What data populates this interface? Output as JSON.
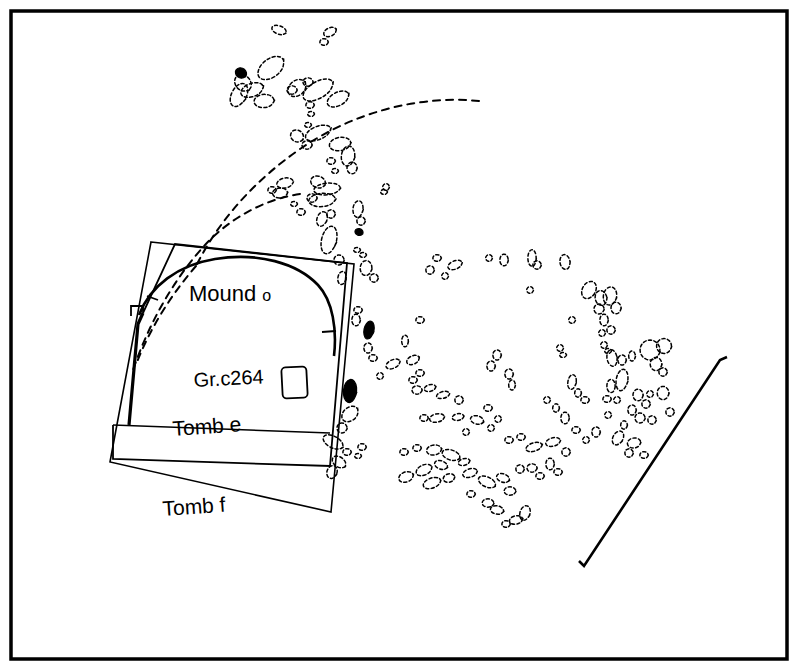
{
  "figure": {
    "type": "archaeological-site-plan",
    "background_color": "#ffffff",
    "ink_color": "#000000",
    "frame": {
      "name": "plan-border",
      "x": 11,
      "y": 11,
      "width": 776,
      "height": 648,
      "stroke_width": 3.5
    }
  },
  "labels": {
    "mound": {
      "text_main": "Mound",
      "text_suffix": "o",
      "x": 189,
      "y": 301,
      "size_main": 22,
      "size_suffix": 16
    },
    "grave": {
      "text": "Gr.c264",
      "x": 194,
      "y": 387,
      "size": 20
    },
    "tomb_e": {
      "text": "Tomb e",
      "x": 173,
      "y": 436,
      "size": 21
    },
    "tomb_f": {
      "text": "Tomb f",
      "x": 163,
      "y": 516,
      "size": 21
    }
  },
  "structures": {
    "tomb_f_outline": {
      "name": "tomb-f-outline",
      "points": "151,242 354,264 331,512 110,462",
      "stroke_width": 1.6
    },
    "tomb_e_outline": {
      "name": "tomb-e-outline",
      "points": "131,316 131,306 143,306 143,313 175,244 347,263 330,466 113,459 113,425",
      "stroke_width": 1.8
    },
    "tomb_e_west_wall": {
      "name": "tomb-e-west-wall",
      "points": "143,313 138,324 129,425",
      "stroke_width": 3.2
    },
    "tomb_e_inner_base": {
      "name": "tomb-e-inner-base",
      "points": "113,425 330,433",
      "stroke_width": 1.5
    },
    "mound_arc": {
      "name": "mound-o-arc",
      "path": "M 139,315 C 150,286 178,265 215,259 C 258,252 297,263 318,285 C 333,301 337,330 334,356",
      "stroke_width": 2.6
    },
    "mound_arc_tick_left": {
      "name": "mound-arc-tick-left",
      "points": "147,296 158,300",
      "stroke_width": 1.8
    },
    "mound_arc_tick_right": {
      "name": "mound-arc-tick-right",
      "points": "322,332 336,331",
      "stroke_width": 1.8
    },
    "grave_rect": {
      "name": "grave-c264-rectangle",
      "x": 282,
      "y": 367,
      "width": 25,
      "height": 31,
      "rx": 4,
      "rotation": -3,
      "stroke_width": 1.8
    },
    "baulk_line": {
      "name": "baulk-diagonal-line",
      "path": "M 727,357 L 720,360 L 584,566 L 579,561",
      "stroke_width": 2.6
    },
    "dashed_arc_outer": {
      "name": "dashed-arc-outer",
      "path": "M 479,101 C 420,95 355,112 303,147 C 254,180 218,222 196,266",
      "stroke_width": 2.0,
      "dash": "7,6"
    },
    "dashed_arc_inner": {
      "name": "dashed-arc-inner",
      "path": "M 300,194 C 266,199 231,217 205,245 C 172,281 148,326 133,370",
      "stroke_width": 2.0,
      "dash": "7,6"
    },
    "dashed_arc_west": {
      "name": "dashed-arc-west",
      "path": "M 196,266 C 170,296 150,329 137,362",
      "stroke_width": 2.0,
      "dash": "7,6"
    }
  },
  "black_stones": [
    {
      "name": "black-stone-nw",
      "cx": 241,
      "cy": 73,
      "rx": 7,
      "ry": 6,
      "rot": 30
    },
    {
      "name": "black-stone-mid",
      "cx": 359,
      "cy": 232,
      "rx": 5,
      "ry": 4,
      "rot": 20
    },
    {
      "name": "black-stone-upper-east",
      "cx": 369,
      "cy": 330,
      "rx": 6,
      "ry": 11,
      "rot": 12
    },
    {
      "name": "black-stone-lower-east",
      "cx": 350,
      "cy": 391,
      "rx": 8,
      "ry": 14,
      "rot": 6
    }
  ],
  "dashed_stones": [
    {
      "cx": 279,
      "cy": 30,
      "rx": 9,
      "ry": 5,
      "rot": 20
    },
    {
      "cx": 324,
      "cy": 42,
      "rx": 5,
      "ry": 4,
      "rot": 0
    },
    {
      "cx": 330,
      "cy": 32,
      "rx": 8,
      "ry": 5,
      "rot": -25
    },
    {
      "cx": 271,
      "cy": 68,
      "rx": 18,
      "ry": 11,
      "rot": -38
    },
    {
      "cx": 297,
      "cy": 88,
      "rx": 12,
      "ry": 9,
      "rot": -40
    },
    {
      "cx": 252,
      "cy": 90,
      "rx": 14,
      "ry": 8,
      "rot": -20
    },
    {
      "cx": 243,
      "cy": 83,
      "rx": 11,
      "ry": 9,
      "rot": 45
    },
    {
      "cx": 239,
      "cy": 95,
      "rx": 9,
      "ry": 15,
      "rot": 28
    },
    {
      "cx": 264,
      "cy": 101,
      "rx": 12,
      "ry": 8,
      "rot": -5
    },
    {
      "cx": 292,
      "cy": 90,
      "rx": 6,
      "ry": 5,
      "rot": 0
    },
    {
      "cx": 318,
      "cy": 90,
      "rx": 20,
      "ry": 10,
      "rot": -30
    },
    {
      "cx": 338,
      "cy": 99,
      "rx": 14,
      "ry": 8,
      "rot": -28
    },
    {
      "cx": 308,
      "cy": 82,
      "rx": 6,
      "ry": 5,
      "rot": 0
    },
    {
      "cx": 310,
      "cy": 105,
      "rx": 5,
      "ry": 4,
      "rot": 0
    },
    {
      "cx": 311,
      "cy": 114,
      "rx": 4,
      "ry": 3,
      "rot": 0
    },
    {
      "cx": 308,
      "cy": 125,
      "rx": 4,
      "ry": 3,
      "rot": 0
    },
    {
      "cx": 318,
      "cy": 133,
      "rx": 16,
      "ry": 8,
      "rot": -22
    },
    {
      "cx": 340,
      "cy": 144,
      "rx": 13,
      "ry": 8,
      "rot": -10
    },
    {
      "cx": 297,
      "cy": 136,
      "rx": 8,
      "ry": 7,
      "rot": 30
    },
    {
      "cx": 307,
      "cy": 145,
      "rx": 6,
      "ry": 5,
      "rot": 0
    },
    {
      "cx": 348,
      "cy": 156,
      "rx": 8,
      "ry": 12,
      "rot": 8
    },
    {
      "cx": 352,
      "cy": 168,
      "rx": 6,
      "ry": 7,
      "rot": 0
    },
    {
      "cx": 331,
      "cy": 161,
      "rx": 5,
      "ry": 4,
      "rot": 0
    },
    {
      "cx": 335,
      "cy": 171,
      "rx": 4,
      "ry": 3,
      "rot": 0
    },
    {
      "cx": 285,
      "cy": 183,
      "rx": 10,
      "ry": 6,
      "rot": -12
    },
    {
      "cx": 280,
      "cy": 193,
      "rx": 9,
      "ry": 6,
      "rot": -5
    },
    {
      "cx": 272,
      "cy": 190,
      "rx": 5,
      "ry": 4,
      "rot": 0
    },
    {
      "cx": 318,
      "cy": 182,
      "rx": 9,
      "ry": 7,
      "rot": 18
    },
    {
      "cx": 327,
      "cy": 189,
      "rx": 16,
      "ry": 7,
      "rot": -6
    },
    {
      "cx": 322,
      "cy": 200,
      "rx": 16,
      "ry": 8,
      "rot": -5
    },
    {
      "cx": 312,
      "cy": 198,
      "rx": 6,
      "ry": 5,
      "rot": 0
    },
    {
      "cx": 294,
      "cy": 204,
      "rx": 4,
      "ry": 3,
      "rot": 0
    },
    {
      "cx": 301,
      "cy": 212,
      "rx": 5,
      "ry": 4,
      "rot": 0
    },
    {
      "cx": 322,
      "cy": 219,
      "rx": 6,
      "ry": 9,
      "rot": 20
    },
    {
      "cx": 331,
      "cy": 214,
      "rx": 5,
      "ry": 5,
      "rot": 0
    },
    {
      "cx": 386,
      "cy": 187,
      "rx": 4,
      "ry": 4,
      "rot": 0
    },
    {
      "cx": 384,
      "cy": 192,
      "rx": 4,
      "ry": 3,
      "rot": 0
    },
    {
      "cx": 358,
      "cy": 209,
      "rx": 6,
      "ry": 10,
      "rot": 6
    },
    {
      "cx": 361,
      "cy": 221,
      "rx": 5,
      "ry": 5,
      "rot": 0
    },
    {
      "cx": 329,
      "cy": 240,
      "rx": 9,
      "ry": 17,
      "rot": 14
    },
    {
      "cx": 339,
      "cy": 260,
      "rx": 6,
      "ry": 6,
      "rot": 0
    },
    {
      "cx": 357,
      "cy": 250,
      "rx": 4,
      "ry": 3,
      "rot": 0
    },
    {
      "cx": 363,
      "cy": 255,
      "rx": 4,
      "ry": 3,
      "rot": 0
    },
    {
      "cx": 342,
      "cy": 278,
      "rx": 5,
      "ry": 8,
      "rot": 10
    },
    {
      "cx": 366,
      "cy": 268,
      "rx": 7,
      "ry": 9,
      "rot": 5
    },
    {
      "cx": 374,
      "cy": 278,
      "rx": 5,
      "ry": 5,
      "rot": 0
    },
    {
      "cx": 358,
      "cy": 310,
      "rx": 5,
      "ry": 4,
      "rot": 0
    },
    {
      "cx": 356,
      "cy": 320,
      "rx": 5,
      "ry": 7,
      "rot": 0
    },
    {
      "cx": 368,
      "cy": 348,
      "rx": 5,
      "ry": 6,
      "rot": 0
    },
    {
      "cx": 373,
      "cy": 358,
      "rx": 5,
      "ry": 4,
      "rot": 0
    },
    {
      "cx": 393,
      "cy": 364,
      "rx": 9,
      "ry": 5,
      "rot": -25
    },
    {
      "cx": 413,
      "cy": 360,
      "rx": 8,
      "ry": 5,
      "rot": -25
    },
    {
      "cx": 380,
      "cy": 376,
      "rx": 4,
      "ry": 4,
      "rot": 0
    },
    {
      "cx": 413,
      "cy": 380,
      "rx": 5,
      "ry": 4,
      "rot": 0
    },
    {
      "cx": 420,
      "cy": 373,
      "rx": 5,
      "ry": 4,
      "rot": 0
    },
    {
      "cx": 417,
      "cy": 390,
      "rx": 6,
      "ry": 5,
      "rot": 0
    },
    {
      "cx": 430,
      "cy": 388,
      "rx": 7,
      "ry": 4,
      "rot": -15
    },
    {
      "cx": 443,
      "cy": 395,
      "rx": 8,
      "ry": 4,
      "rot": -15
    },
    {
      "cx": 350,
      "cy": 414,
      "rx": 11,
      "ry": 8,
      "rot": -40
    },
    {
      "cx": 342,
      "cy": 428,
      "rx": 6,
      "ry": 6,
      "rot": 0
    },
    {
      "cx": 333,
      "cy": 442,
      "rx": 13,
      "ry": 7,
      "rot": 28
    },
    {
      "cx": 347,
      "cy": 452,
      "rx": 5,
      "ry": 4,
      "rot": 0
    },
    {
      "cx": 362,
      "cy": 447,
      "rx": 5,
      "ry": 4,
      "rot": 0
    },
    {
      "cx": 358,
      "cy": 456,
      "rx": 4,
      "ry": 3,
      "rot": 0
    },
    {
      "cx": 339,
      "cy": 462,
      "rx": 9,
      "ry": 6,
      "rot": 35
    },
    {
      "cx": 332,
      "cy": 472,
      "rx": 6,
      "ry": 8,
      "rot": 20
    },
    {
      "cx": 404,
      "cy": 452,
      "rx": 5,
      "ry": 4,
      "rot": 0
    },
    {
      "cx": 417,
      "cy": 448,
      "rx": 5,
      "ry": 4,
      "rot": 0
    },
    {
      "cx": 434,
      "cy": 450,
      "rx": 9,
      "ry": 6,
      "rot": -10
    },
    {
      "cx": 451,
      "cy": 455,
      "rx": 11,
      "ry": 6,
      "rot": 18
    },
    {
      "cx": 441,
      "cy": 465,
      "rx": 8,
      "ry": 5,
      "rot": 20
    },
    {
      "cx": 464,
      "cy": 462,
      "rx": 7,
      "ry": 4,
      "rot": -15
    },
    {
      "cx": 430,
      "cy": 270,
      "rx": 5,
      "ry": 5,
      "rot": 0
    },
    {
      "cx": 437,
      "cy": 258,
      "rx": 5,
      "ry": 4,
      "rot": 0
    },
    {
      "cx": 455,
      "cy": 265,
      "rx": 9,
      "ry": 5,
      "rot": -22
    },
    {
      "cx": 504,
      "cy": 260,
      "rx": 5,
      "ry": 7,
      "rot": 0
    },
    {
      "cx": 532,
      "cy": 258,
      "rx": 5,
      "ry": 10,
      "rot": 0
    },
    {
      "cx": 537,
      "cy": 265,
      "rx": 5,
      "ry": 5,
      "rot": 0
    },
    {
      "cx": 565,
      "cy": 262,
      "rx": 6,
      "ry": 9,
      "rot": -8
    },
    {
      "cx": 489,
      "cy": 258,
      "rx": 4,
      "ry": 4,
      "rot": 0
    },
    {
      "cx": 589,
      "cy": 290,
      "rx": 8,
      "ry": 11,
      "rot": 30
    },
    {
      "cx": 601,
      "cy": 298,
      "rx": 7,
      "ry": 9,
      "rot": -10
    },
    {
      "cx": 610,
      "cy": 296,
      "rx": 8,
      "ry": 11,
      "rot": 10
    },
    {
      "cx": 616,
      "cy": 308,
      "rx": 6,
      "ry": 7,
      "rot": 0
    },
    {
      "cx": 599,
      "cy": 309,
      "rx": 6,
      "ry": 6,
      "rot": 0
    },
    {
      "cx": 604,
      "cy": 320,
      "rx": 5,
      "ry": 7,
      "rot": 0
    },
    {
      "cx": 611,
      "cy": 330,
      "rx": 5,
      "ry": 5,
      "rot": 0
    },
    {
      "cx": 602,
      "cy": 333,
      "rx": 4,
      "ry": 4,
      "rot": 0
    },
    {
      "cx": 604,
      "cy": 345,
      "rx": 4,
      "ry": 4,
      "rot": 0
    },
    {
      "cx": 608,
      "cy": 351,
      "rx": 4,
      "ry": 3,
      "rot": 0
    },
    {
      "cx": 405,
      "cy": 341,
      "rx": 4,
      "ry": 7,
      "rot": 0
    },
    {
      "cx": 497,
      "cy": 355,
      "rx": 5,
      "ry": 6,
      "rot": 0
    },
    {
      "cx": 491,
      "cy": 366,
      "rx": 5,
      "ry": 6,
      "rot": 0
    },
    {
      "cx": 560,
      "cy": 348,
      "rx": 4,
      "ry": 4,
      "rot": 0
    },
    {
      "cx": 563,
      "cy": 355,
      "rx": 4,
      "ry": 3,
      "rot": 0
    },
    {
      "cx": 612,
      "cy": 358,
      "rx": 6,
      "ry": 10,
      "rot": -10
    },
    {
      "cx": 622,
      "cy": 360,
      "rx": 5,
      "ry": 6,
      "rot": 0
    },
    {
      "cx": 632,
      "cy": 356,
      "rx": 4,
      "ry": 6,
      "rot": 0
    },
    {
      "cx": 650,
      "cy": 350,
      "rx": 12,
      "ry": 12,
      "rot": 10
    },
    {
      "cx": 664,
      "cy": 346,
      "rx": 9,
      "ry": 9,
      "rot": 0
    },
    {
      "cx": 656,
      "cy": 364,
      "rx": 7,
      "ry": 8,
      "rot": 0
    },
    {
      "cx": 663,
      "cy": 372,
      "rx": 5,
      "ry": 5,
      "rot": 0
    },
    {
      "cx": 622,
      "cy": 380,
      "rx": 7,
      "ry": 13,
      "rot": 10
    },
    {
      "cx": 611,
      "cy": 386,
      "rx": 5,
      "ry": 8,
      "rot": 0
    },
    {
      "cx": 607,
      "cy": 399,
      "rx": 5,
      "ry": 4,
      "rot": 0
    },
    {
      "cx": 509,
      "cy": 374,
      "rx": 5,
      "ry": 6,
      "rot": 0
    },
    {
      "cx": 512,
      "cy": 385,
      "rx": 4,
      "ry": 6,
      "rot": 0
    },
    {
      "cx": 572,
      "cy": 382,
      "rx": 5,
      "ry": 9,
      "rot": 10
    },
    {
      "cx": 578,
      "cy": 393,
      "rx": 4,
      "ry": 5,
      "rot": 0
    },
    {
      "cx": 585,
      "cy": 400,
      "rx": 5,
      "ry": 4,
      "rot": 0
    },
    {
      "cx": 617,
      "cy": 400,
      "rx": 4,
      "ry": 4,
      "rot": 0
    },
    {
      "cx": 638,
      "cy": 395,
      "rx": 6,
      "ry": 7,
      "rot": 0
    },
    {
      "cx": 646,
      "cy": 404,
      "rx": 5,
      "ry": 5,
      "rot": 0
    },
    {
      "cx": 650,
      "cy": 394,
      "rx": 4,
      "ry": 4,
      "rot": 0
    },
    {
      "cx": 663,
      "cy": 393,
      "rx": 7,
      "ry": 8,
      "rot": 0
    },
    {
      "cx": 632,
      "cy": 410,
      "rx": 5,
      "ry": 6,
      "rot": 0
    },
    {
      "cx": 640,
      "cy": 418,
      "rx": 6,
      "ry": 6,
      "rot": 0
    },
    {
      "cx": 624,
      "cy": 425,
      "rx": 4,
      "ry": 5,
      "rot": 0
    },
    {
      "cx": 652,
      "cy": 420,
      "rx": 5,
      "ry": 5,
      "rot": 0
    },
    {
      "cx": 670,
      "cy": 412,
      "rx": 5,
      "ry": 5,
      "rot": 0
    },
    {
      "cx": 608,
      "cy": 415,
      "rx": 4,
      "ry": 4,
      "rot": 0
    },
    {
      "cx": 618,
      "cy": 438,
      "rx": 6,
      "ry": 9,
      "rot": 30
    },
    {
      "cx": 634,
      "cy": 443,
      "rx": 8,
      "ry": 6,
      "rot": -10
    },
    {
      "cx": 629,
      "cy": 453,
      "rx": 5,
      "ry": 5,
      "rot": 0
    },
    {
      "cx": 644,
      "cy": 455,
      "rx": 5,
      "ry": 4,
      "rot": 0
    },
    {
      "cx": 596,
      "cy": 432,
      "rx": 5,
      "ry": 6,
      "rot": 0
    },
    {
      "cx": 586,
      "cy": 440,
      "rx": 4,
      "ry": 4,
      "rot": 0
    },
    {
      "cx": 576,
      "cy": 430,
      "rx": 5,
      "ry": 4,
      "rot": 0
    },
    {
      "cx": 565,
      "cy": 418,
      "rx": 5,
      "ry": 7,
      "rot": 0
    },
    {
      "cx": 556,
      "cy": 408,
      "rx": 4,
      "ry": 5,
      "rot": 0
    },
    {
      "cx": 547,
      "cy": 400,
      "rx": 4,
      "ry": 4,
      "rot": 0
    },
    {
      "cx": 498,
      "cy": 419,
      "rx": 4,
      "ry": 4,
      "rot": 0
    },
    {
      "cx": 491,
      "cy": 428,
      "rx": 4,
      "ry": 4,
      "rot": 0
    },
    {
      "cx": 424,
      "cy": 418,
      "rx": 5,
      "ry": 4,
      "rot": 0
    },
    {
      "cx": 437,
      "cy": 418,
      "rx": 9,
      "ry": 5,
      "rot": -12
    },
    {
      "cx": 458,
      "cy": 417,
      "rx": 7,
      "ry": 4,
      "rot": -10
    },
    {
      "cx": 477,
      "cy": 420,
      "rx": 8,
      "ry": 5,
      "rot": 15
    },
    {
      "cx": 488,
      "cy": 408,
      "rx": 5,
      "ry": 4,
      "rot": 0
    },
    {
      "cx": 509,
      "cy": 440,
      "rx": 5,
      "ry": 4,
      "rot": 0
    },
    {
      "cx": 521,
      "cy": 437,
      "rx": 5,
      "ry": 4,
      "rot": 0
    },
    {
      "cx": 534,
      "cy": 447,
      "rx": 10,
      "ry": 5,
      "rot": -18
    },
    {
      "cx": 553,
      "cy": 442,
      "rx": 9,
      "ry": 5,
      "rot": -15
    },
    {
      "cx": 566,
      "cy": 452,
      "rx": 5,
      "ry": 5,
      "rot": 0
    },
    {
      "cx": 420,
      "cy": 320,
      "rx": 5,
      "ry": 4,
      "rot": 0
    },
    {
      "cx": 445,
      "cy": 276,
      "rx": 4,
      "ry": 4,
      "rot": 0
    },
    {
      "cx": 530,
      "cy": 290,
      "rx": 4,
      "ry": 4,
      "rot": 0
    },
    {
      "cx": 572,
      "cy": 320,
      "rx": 4,
      "ry": 4,
      "rot": 0
    },
    {
      "cx": 406,
      "cy": 477,
      "rx": 9,
      "ry": 6,
      "rot": -20
    },
    {
      "cx": 424,
      "cy": 470,
      "rx": 10,
      "ry": 6,
      "rot": -25
    },
    {
      "cx": 432,
      "cy": 483,
      "rx": 11,
      "ry": 6,
      "rot": -20
    },
    {
      "cx": 449,
      "cy": 478,
      "rx": 7,
      "ry": 5,
      "rot": -15
    },
    {
      "cx": 470,
      "cy": 473,
      "rx": 9,
      "ry": 5,
      "rot": -18
    },
    {
      "cx": 487,
      "cy": 482,
      "rx": 11,
      "ry": 6,
      "rot": 25
    },
    {
      "cx": 503,
      "cy": 478,
      "rx": 8,
      "ry": 5,
      "rot": 20
    },
    {
      "cx": 510,
      "cy": 491,
      "rx": 7,
      "ry": 5,
      "rot": 0
    },
    {
      "cx": 520,
      "cy": 469,
      "rx": 5,
      "ry": 5,
      "rot": 0
    },
    {
      "cx": 532,
      "cy": 468,
      "rx": 6,
      "ry": 5,
      "rot": 0
    },
    {
      "cx": 540,
      "cy": 476,
      "rx": 5,
      "ry": 4,
      "rot": 0
    },
    {
      "cx": 550,
      "cy": 464,
      "rx": 5,
      "ry": 7,
      "rot": 0
    },
    {
      "cx": 558,
      "cy": 472,
      "rx": 5,
      "ry": 4,
      "rot": 0
    },
    {
      "cx": 488,
      "cy": 503,
      "rx": 7,
      "ry": 5,
      "rot": 0
    },
    {
      "cx": 497,
      "cy": 510,
      "rx": 8,
      "ry": 5,
      "rot": 10
    },
    {
      "cx": 471,
      "cy": 494,
      "rx": 5,
      "ry": 4,
      "rot": 0
    },
    {
      "cx": 525,
      "cy": 513,
      "rx": 6,
      "ry": 9,
      "rot": 18
    },
    {
      "cx": 516,
      "cy": 520,
      "rx": 8,
      "ry": 5,
      "rot": -12
    },
    {
      "cx": 506,
      "cy": 524,
      "rx": 5,
      "ry": 4,
      "rot": 0
    },
    {
      "cx": 466,
      "cy": 432,
      "rx": 4,
      "ry": 4,
      "rot": 0
    },
    {
      "cx": 459,
      "cy": 400,
      "rx": 5,
      "ry": 5,
      "rot": 0
    }
  ]
}
